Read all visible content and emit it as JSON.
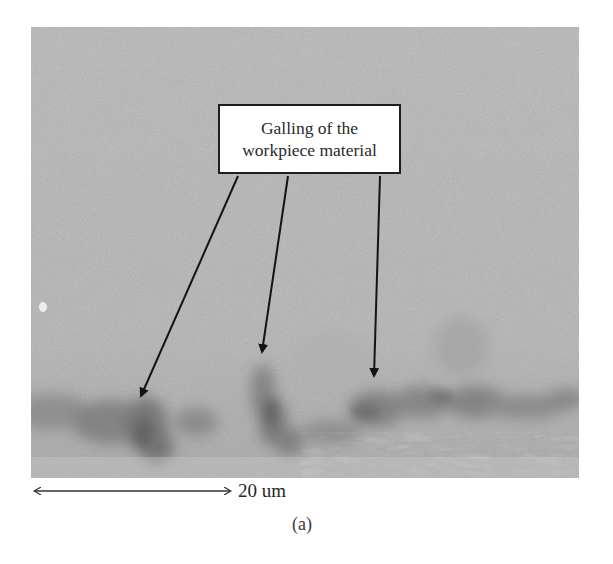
{
  "figure": {
    "panel_label": "(a)",
    "callout": {
      "line1": "Galling of the",
      "line2": "workpiece material"
    },
    "scale_bar": {
      "label": "20 um",
      "direction": "double-arrow-horizontal"
    },
    "annotations": [
      {
        "id": "arrow-1",
        "from": [
          238,
          176
        ],
        "to": [
          139,
          401
        ]
      },
      {
        "id": "arrow-2",
        "from": [
          288,
          176
        ],
        "to": [
          261,
          357
        ]
      },
      {
        "id": "arrow-3",
        "from": [
          380,
          176
        ],
        "to": [
          374,
          381
        ]
      }
    ],
    "image": {
      "type": "grayscale-micrograph",
      "description": "Machined surface with darker galling regions along bottom edge"
    },
    "colors": {
      "background": "#ffffff",
      "micrograph_base": "#c3c3c3",
      "galling_dark": "#6e6e6e",
      "ink": "#1e1e1e"
    }
  }
}
